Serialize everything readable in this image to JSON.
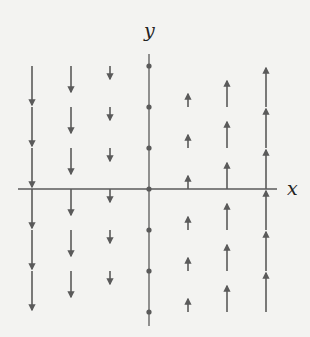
{
  "diagram": {
    "type": "vector-field",
    "field": "F(x, y) = x j",
    "x_axis_label": "x",
    "y_axis_label": "y",
    "colors": {
      "background": "#f3f3f1",
      "stroke": "#5a5a5a",
      "label": "#222222"
    },
    "grid": {
      "x_values": [
        -3,
        -2,
        -1,
        0,
        1,
        2,
        3
      ],
      "origin_px": [
        149,
        189
      ],
      "spacing_px_x": 39,
      "spacing_px_y": 41,
      "vector_scale_px": 13
    },
    "columns": [
      {
        "x": -3,
        "direction": "down",
        "tail_rows": [
          3,
          2,
          1,
          0,
          -1,
          -2
        ]
      },
      {
        "x": -2,
        "direction": "down",
        "tail_rows": [
          3,
          2,
          1,
          0,
          -1,
          -2
        ]
      },
      {
        "x": -1,
        "direction": "down",
        "tail_rows": [
          3,
          2,
          1,
          0,
          -1,
          -2
        ]
      },
      {
        "x": 0,
        "direction": "none",
        "tail_rows": [
          3,
          2,
          1,
          0,
          -1,
          -2,
          -3
        ]
      },
      {
        "x": 1,
        "direction": "up",
        "tail_rows": [
          2,
          1,
          0,
          -1,
          -2,
          -3
        ]
      },
      {
        "x": 2,
        "direction": "up",
        "tail_rows": [
          2,
          1,
          0,
          -1,
          -2,
          -3
        ]
      },
      {
        "x": 3,
        "direction": "up",
        "tail_rows": [
          2,
          1,
          0,
          -1,
          -2,
          -3
        ]
      }
    ],
    "axes": {
      "x_axis": {
        "from_px": 18,
        "to_px": 277
      },
      "y_axis": {
        "from_px": 54,
        "to_px": 326
      }
    }
  }
}
